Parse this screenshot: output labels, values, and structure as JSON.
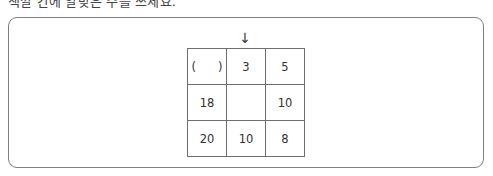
{
  "question": {
    "cut_off_text": "색깔 칸에 알맞은 수를 쓰세요."
  },
  "puzzle": {
    "arrow": "↓",
    "grid": [
      [
        {
          "type": "answer_blank",
          "open": "(",
          "close": ")"
        },
        {
          "value": "3"
        },
        {
          "value": "5"
        }
      ],
      [
        {
          "value": "18"
        },
        {
          "value": ""
        },
        {
          "value": "10"
        }
      ],
      [
        {
          "value": "20"
        },
        {
          "value": "10"
        },
        {
          "value": "8"
        }
      ]
    ],
    "cells": {
      "r0c0_open": "(",
      "r0c0_close": ")",
      "r0c1": "3",
      "r0c2": "5",
      "r1c0": "18",
      "r1c1": "",
      "r1c2": "10",
      "r2c0": "20",
      "r2c1": "10",
      "r2c2": "8"
    }
  },
  "colors": {
    "frame_border": "#808080",
    "grid_border": "#6e6e6e",
    "text": "#333333"
  }
}
